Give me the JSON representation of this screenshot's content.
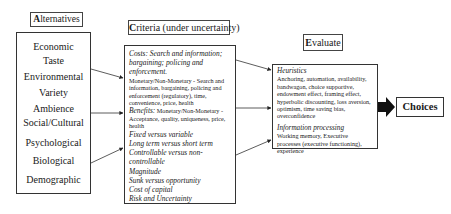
{
  "alternatives": {
    "title_cap": "A",
    "title_rest": "lternatives",
    "items": [
      "Economic",
      "Taste",
      "Environmental",
      "Variety",
      "Ambience",
      "Social/Cultural",
      "Psychological",
      "Biological",
      "Demographic"
    ]
  },
  "criteria": {
    "title_cap": "C",
    "title_rest": "riteria (under uncertainty)",
    "costs_heading": "Costs: Search and information; bargaining; policing and enforcement.",
    "costs_detail": "Monetary/Non-Monetary - Search and information, bargaining, policing and enforcement (regulatory), time, convenience, price, health",
    "benefits_heading": "Benefits:",
    "benefits_detail": " Monetary/Non-Monetary - Acceptance, quality, uniqueness, price, health",
    "items": [
      "Fixed versus variable",
      "Long term versus short term",
      "Controllable versus non-controllable",
      "Magnitude",
      "Sunk versus opportunity",
      "Cost of capital",
      "Risk and Uncertainty"
    ]
  },
  "evaluate": {
    "title_cap": "E",
    "title_rest": "valuate",
    "heuristics_heading": "Heuristics",
    "heuristics_detail": "Anchoring, automation, availability, bandwagon, choice supportive, endowment effect, framing effect, hyperbolic discounting, loss aversion, optimism, time saving bias, overconfidence",
    "info_heading": "Information processing",
    "info_detail": "Working memory, Executive processes (executive functioning), experience"
  },
  "output": {
    "label": "Choices"
  }
}
